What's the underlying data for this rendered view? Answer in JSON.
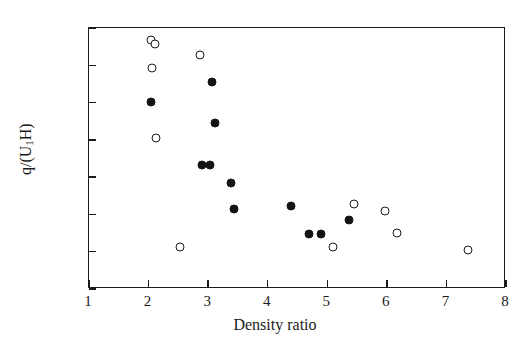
{
  "chart_data": {
    "type": "scatter",
    "title": "",
    "xlabel": "Density ratio",
    "ylabel": "q/(U₁H)",
    "xlim": [
      1,
      8
    ],
    "ylim": [
      0.005,
      0.04
    ],
    "xticks": [
      "1",
      "2",
      "3",
      "4",
      "5",
      "6",
      "7",
      "8"
    ],
    "yticks": [
      "0.040",
      "0.035",
      "0.030",
      "0.025",
      "0.020",
      "0.015",
      "0.010",
      "0.005"
    ],
    "xtick_values": [
      1,
      2,
      3,
      4,
      5,
      6,
      7,
      8
    ],
    "ytick_values": [
      0.04,
      0.035,
      0.03,
      0.025,
      0.02,
      0.015,
      0.01,
      0.005
    ],
    "grid": false,
    "legend": null,
    "legend_position": "none",
    "marker_colors": {
      "filled": "#141414",
      "open_edge": "#1a1a1a",
      "open_face": "#ffffff"
    },
    "series": [
      {
        "name": "open-circles",
        "marker": "open",
        "points": [
          {
            "x": 2.04,
            "y": 0.0384
          },
          {
            "x": 2.11,
            "y": 0.0378
          },
          {
            "x": 2.06,
            "y": 0.0347
          },
          {
            "x": 2.13,
            "y": 0.0253
          },
          {
            "x": 2.53,
            "y": 0.0106
          },
          {
            "x": 2.87,
            "y": 0.0364
          },
          {
            "x": 5.1,
            "y": 0.0106
          },
          {
            "x": 5.45,
            "y": 0.0164
          },
          {
            "x": 5.97,
            "y": 0.0155
          },
          {
            "x": 6.17,
            "y": 0.0125
          },
          {
            "x": 7.36,
            "y": 0.0102
          }
        ]
      },
      {
        "name": "filled-circles",
        "marker": "filled",
        "points": [
          {
            "x": 2.04,
            "y": 0.0301
          },
          {
            "x": 3.06,
            "y": 0.0327
          },
          {
            "x": 3.12,
            "y": 0.0272
          },
          {
            "x": 2.9,
            "y": 0.0216
          },
          {
            "x": 3.03,
            "y": 0.0216
          },
          {
            "x": 3.38,
            "y": 0.0192
          },
          {
            "x": 3.44,
            "y": 0.0157
          },
          {
            "x": 4.39,
            "y": 0.0161
          },
          {
            "x": 4.7,
            "y": 0.0124
          },
          {
            "x": 4.9,
            "y": 0.0124
          },
          {
            "x": 5.37,
            "y": 0.0143
          }
        ]
      }
    ]
  }
}
